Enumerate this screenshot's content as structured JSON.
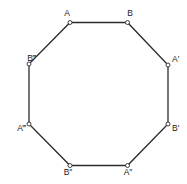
{
  "diagram": {
    "shape": "regular-octagon",
    "colors": {
      "stroke": "#2b2b2b",
      "vertex_fill": "#ffffff",
      "label": "#222222",
      "background": "#ffffff"
    },
    "vertices": [
      {
        "id": "A",
        "label": "A",
        "x": 70,
        "y": 22.5,
        "lx": 67,
        "ly": 16,
        "anchor": "middle"
      },
      {
        "id": "B",
        "label": "B",
        "x": 127.5,
        "y": 22.5,
        "lx": 130,
        "ly": 16,
        "anchor": "middle"
      },
      {
        "id": "A1",
        "label": "A′",
        "x": 168,
        "y": 65,
        "lx": 172,
        "ly": 62,
        "anchor": "start"
      },
      {
        "id": "B1",
        "label": "B′",
        "x": 168,
        "y": 124,
        "lx": 172,
        "ly": 131,
        "anchor": "start"
      },
      {
        "id": "A2",
        "label": "A″",
        "x": 127.5,
        "y": 165.5,
        "lx": 128,
        "ly": 175,
        "anchor": "middle"
      },
      {
        "id": "B2",
        "label": "B″",
        "x": 70,
        "y": 165.5,
        "lx": 68,
        "ly": 175,
        "anchor": "middle"
      },
      {
        "id": "A3",
        "label": "A‴",
        "x": 29,
        "y": 124,
        "lx": 26,
        "ly": 131,
        "anchor": "end"
      },
      {
        "id": "B3",
        "label": "B‴",
        "x": 29,
        "y": 64,
        "lx": 36,
        "ly": 61,
        "anchor": "end"
      }
    ]
  }
}
